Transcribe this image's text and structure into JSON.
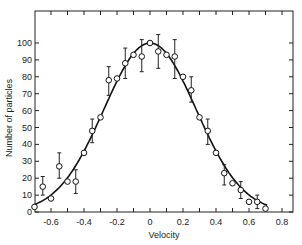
{
  "chart_data": {
    "type": "scatter",
    "title": "",
    "xlabel": "Velocity",
    "ylabel": "Number of particles",
    "xlim": [
      -0.7,
      0.87
    ],
    "ylim": [
      0,
      118
    ],
    "x_ticks": [
      -0.6,
      -0.4,
      -0.2,
      0,
      0.2,
      0.4,
      0.6,
      0.8
    ],
    "x_tick_labels": [
      "-0.6",
      "-0.4",
      "-0.2",
      "0",
      "0.2",
      "0.4",
      "0.6",
      "0.8"
    ],
    "y_ticks": [
      0,
      10,
      20,
      30,
      40,
      50,
      60,
      70,
      80,
      90,
      100
    ],
    "y_tick_labels": [
      "0",
      "10",
      "20",
      "30",
      "40",
      "50",
      "60",
      "70",
      "80",
      "90",
      "100"
    ],
    "grid": false,
    "legend": null,
    "series": [
      {
        "name": "Measured",
        "marker": "open-circle",
        "points": [
          {
            "x": -0.7,
            "y": 3
          },
          {
            "x": -0.65,
            "y": 15,
            "err_low": 10,
            "err_high": 21
          },
          {
            "x": -0.6,
            "y": 8
          },
          {
            "x": -0.55,
            "y": 27,
            "err_low": 20,
            "err_high": 35
          },
          {
            "x": -0.5,
            "y": 18
          },
          {
            "x": -0.45,
            "y": 18,
            "err_low": 11,
            "err_high": 25
          },
          {
            "x": -0.4,
            "y": 35
          },
          {
            "x": -0.35,
            "y": 48,
            "err_low": 41,
            "err_high": 55
          },
          {
            "x": -0.3,
            "y": 56
          },
          {
            "x": -0.25,
            "y": 78,
            "err_low": 69,
            "err_high": 86
          },
          {
            "x": -0.2,
            "y": 79
          },
          {
            "x": -0.15,
            "y": 88,
            "err_low": 79,
            "err_high": 97
          },
          {
            "x": -0.1,
            "y": 93
          },
          {
            "x": -0.05,
            "y": 92,
            "err_low": 83,
            "err_high": 102
          },
          {
            "x": 0.0,
            "y": 100
          },
          {
            "x": 0.05,
            "y": 95,
            "err_low": 85,
            "err_high": 105
          },
          {
            "x": 0.1,
            "y": 93
          },
          {
            "x": 0.15,
            "y": 92,
            "err_low": 79,
            "err_high": 102
          },
          {
            "x": 0.2,
            "y": 80
          },
          {
            "x": 0.25,
            "y": 72,
            "err_low": 65,
            "err_high": 80
          },
          {
            "x": 0.3,
            "y": 56
          },
          {
            "x": 0.35,
            "y": 48,
            "err_low": 40,
            "err_high": 55
          },
          {
            "x": 0.4,
            "y": 35
          },
          {
            "x": 0.45,
            "y": 23,
            "err_low": 16,
            "err_high": 28
          },
          {
            "x": 0.5,
            "y": 17
          },
          {
            "x": 0.55,
            "y": 13,
            "err_low": 8,
            "err_high": 18
          },
          {
            "x": 0.6,
            "y": 6
          },
          {
            "x": 0.65,
            "y": 6,
            "err_low": 2,
            "err_high": 10
          },
          {
            "x": 0.7,
            "y": 2
          }
        ]
      },
      {
        "name": "Gaussian fit",
        "style": "solid-line",
        "function": "100*exp(-x^2/(2*0.28^2))",
        "peak": 100,
        "center": 0,
        "sigma": 0.28
      }
    ]
  }
}
